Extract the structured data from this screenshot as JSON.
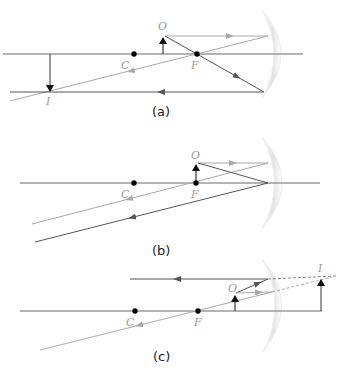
{
  "colors": {
    "axis": "#6a6a6a",
    "ray_dark": "#555555",
    "ray_light": "#a8a8a8",
    "arrow_dark": "#111111",
    "label": "#9a9a9a",
    "caption": "#222222",
    "mirror": "#e6e6e6"
  },
  "panels": [
    {
      "id": "a",
      "caption": "(a)",
      "labels": {
        "object": "O",
        "center": "C",
        "focus": "F",
        "image": "I"
      }
    },
    {
      "id": "b",
      "caption": "(b)",
      "labels": {
        "object": "O",
        "center": "C",
        "focus": "F"
      }
    },
    {
      "id": "c",
      "caption": "(c)",
      "labels": {
        "object": "O",
        "center": "C",
        "focus": "F",
        "image": "I"
      }
    }
  ]
}
